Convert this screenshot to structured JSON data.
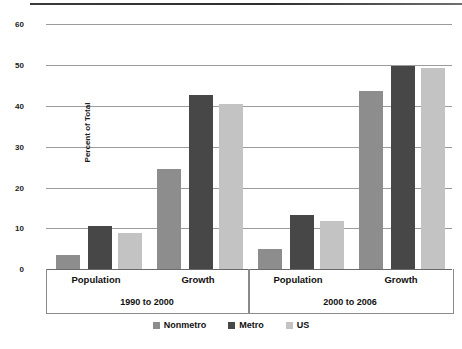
{
  "chart_data": {
    "type": "bar",
    "title": "",
    "xlabel": "",
    "ylabel": "Percent of Total",
    "ylim": [
      0,
      60
    ],
    "ytick_labels": [
      "0",
      "10",
      "20",
      "30",
      "40",
      "50",
      "60"
    ],
    "yticks": [
      0,
      10,
      20,
      30,
      40,
      50,
      60
    ],
    "grid": true,
    "legend_position": "bottom",
    "categories": [
      "Population",
      "Growth",
      "Population",
      "Growth"
    ],
    "groups": [
      {
        "period": "1990 to 2000",
        "categories": [
          "Population",
          "Growth"
        ]
      },
      {
        "period": "2000 to 2006",
        "categories": [
          "Population",
          "Growth"
        ]
      }
    ],
    "series": [
      {
        "name": "Nonmetro",
        "color": "#8d8d8d",
        "values": [
          3.4,
          24.5,
          4.8,
          43.6
        ]
      },
      {
        "name": "Metro",
        "color": "#474747",
        "values": [
          10.6,
          42.5,
          13.3,
          49.8
        ]
      },
      {
        "name": "US",
        "color": "#c3c3c3",
        "values": [
          8.7,
          40.3,
          11.7,
          49.3
        ]
      }
    ]
  },
  "axis": {
    "y_title": "Percent of Total",
    "ticks": [
      "60",
      "50",
      "40",
      "30",
      "20",
      "10",
      "0"
    ]
  },
  "categories": {
    "g1c1": "Population",
    "g1c2": "Growth",
    "g2c1": "Population",
    "g2c2": "Growth"
  },
  "periods": {
    "p1": "1990 to 2000",
    "p2": "2000 to 2006"
  },
  "legend": {
    "items": [
      {
        "label": "Nonmetro",
        "color": "#8d8d8d"
      },
      {
        "label": "Metro",
        "color": "#474747"
      },
      {
        "label": "US",
        "color": "#c3c3c3"
      }
    ]
  }
}
